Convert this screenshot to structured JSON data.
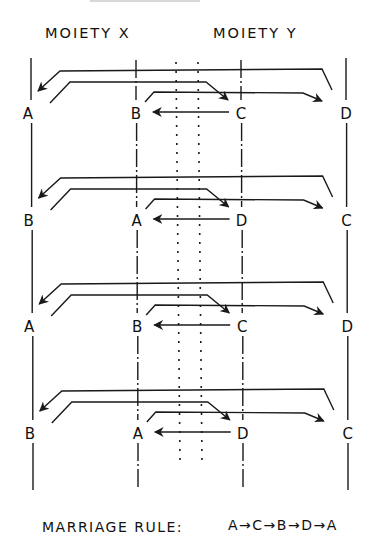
{
  "header": {
    "moiety_x": "MOIETY X",
    "moiety_y": "MOIETY Y"
  },
  "columns": {
    "line_x": [
      31,
      136,
      241,
      346
    ],
    "line_styles": [
      "solid",
      "dash-dot",
      "dash-dot",
      "solid"
    ],
    "dotted_x": [
      176,
      198
    ]
  },
  "rows": [
    {
      "y": 113,
      "labels": [
        "A",
        "B",
        "C",
        "D"
      ]
    },
    {
      "y": 220,
      "labels": [
        "B",
        "A",
        "D",
        "C"
      ]
    },
    {
      "y": 326,
      "labels": [
        "A",
        "B",
        "C",
        "D"
      ]
    },
    {
      "y": 433,
      "labels": [
        "B",
        "A",
        "D",
        "C"
      ]
    }
  ],
  "footer": {
    "marriage_rule_label": "MARRIAGE RULE:",
    "marriage_rule_sequence": "A→C→B→D→A"
  },
  "colors": {
    "ink": "#1a1a1a",
    "background": "#ffffff"
  }
}
